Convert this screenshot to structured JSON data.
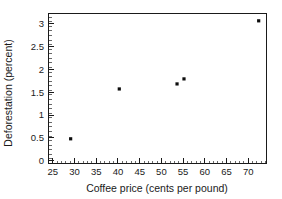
{
  "chart_data": {
    "type": "scatter",
    "title": "",
    "xlabel": "Coffee price (cents per pound)",
    "ylabel": "Deforestation (percent)",
    "xlim": [
      24.0,
      74.2
    ],
    "ylim": [
      -0.06,
      3.22
    ],
    "grid": false,
    "legend": null,
    "legend_position": "none",
    "x_major_ticks": [
      25,
      30,
      35,
      40,
      45,
      50,
      55,
      60,
      65,
      70
    ],
    "x_major_tick_labels": [
      "25",
      "30",
      "35",
      "40",
      "45",
      "50",
      "55",
      "60",
      "65",
      "70"
    ],
    "x_minor_tick_step": 1,
    "y_major_ticks": [
      0,
      0.5,
      1,
      1.5,
      2,
      2.5,
      3
    ],
    "y_major_tick_labels": [
      "0",
      "0.5",
      "1",
      "1.5",
      "2",
      "2.5",
      "3"
    ],
    "y_minor_tick_step": 0.1,
    "marker": "square",
    "marker_color": "#0d0d0d",
    "marker_size_px": 3.2,
    "points": [
      {
        "x": 29.1,
        "y": 0.48
      },
      {
        "x": 40.3,
        "y": 1.57
      },
      {
        "x": 53.6,
        "y": 1.68
      },
      {
        "x": 55.2,
        "y": 1.79
      },
      {
        "x": 72.4,
        "y": 3.06
      }
    ],
    "x": [
      29.1,
      40.3,
      53.6,
      55.2,
      72.4
    ],
    "values": [
      0.48,
      1.57,
      1.68,
      1.79,
      3.06
    ]
  },
  "figure": {
    "background_color": "#ffffff",
    "axis_color": "#1a1a1a",
    "frame": "box"
  }
}
